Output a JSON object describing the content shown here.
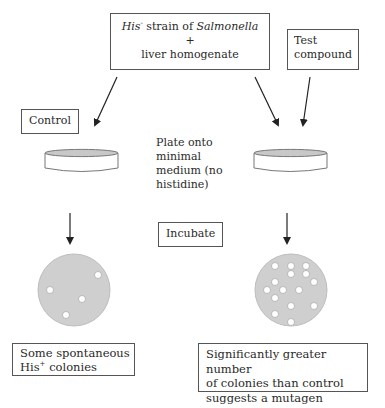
{
  "diagram": {
    "source_box": {
      "line1_part1": "His",
      "line1_sup": "-",
      "line1_part2": " strain of ",
      "line1_part3": "Salmonella",
      "line2": "+",
      "line3": "liver homogenate"
    },
    "test_compound_box": {
      "line1": "Test",
      "line2": "compound"
    },
    "control_label": "Control",
    "plate_step": {
      "line1": "Plate onto",
      "line2": "minimal",
      "line3": "medium (no",
      "line4": "histidine)"
    },
    "incubate_label": "Incubate",
    "control_result": {
      "line1": "Some spontaneous",
      "line2_part1": "His",
      "line2_sup": "+",
      "line2_part2": " colonies"
    },
    "test_result": {
      "line1": "Significantly greater number",
      "line2": "of colonies than control",
      "line3": "suggests a mutagen"
    },
    "control_colony_count": 4,
    "test_colony_count": 15,
    "colors": {
      "plate_fill": "#cfcfcf",
      "colony_fill": "#ffffff",
      "line": "#333333"
    }
  }
}
